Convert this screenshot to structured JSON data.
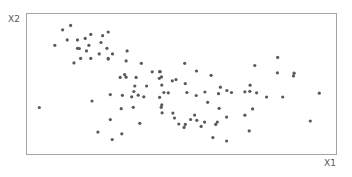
{
  "chart_data": {
    "type": "scatter",
    "title": "",
    "xlabel": "X1",
    "ylabel": "X2",
    "grid": false,
    "legend": null,
    "axis_ticks": false,
    "marker_color": "#595959",
    "frame_color": "#a6a6a6",
    "xlim": [
      0,
      100
    ],
    "ylim": [
      0,
      100
    ],
    "points": [
      [
        14.4,
        91.2
      ],
      [
        11.8,
        88.1
      ],
      [
        13.3,
        80.9
      ],
      [
        16.6,
        80.9
      ],
      [
        9.3,
        77.1
      ],
      [
        16.6,
        75.0
      ],
      [
        17.6,
        67.8
      ],
      [
        20.3,
        77.1
      ],
      [
        26.5,
        86.5
      ],
      [
        20.9,
        84.8
      ],
      [
        24.7,
        83.9
      ],
      [
        19.1,
        82.0
      ],
      [
        24.2,
        79.1
      ],
      [
        17.2,
        74.8
      ],
      [
        26.1,
        75.0
      ],
      [
        19.5,
        73.1
      ],
      [
        23.6,
        71.0
      ],
      [
        27.9,
        71.0
      ],
      [
        15.5,
        64.6
      ],
      [
        20.9,
        67.8
      ],
      [
        26.5,
        67.3
      ],
      [
        32.6,
        73.1
      ],
      [
        37.2,
        64.3
      ],
      [
        32.3,
        66.0
      ],
      [
        35.5,
        54.3
      ],
      [
        31.8,
        56.3
      ],
      [
        32.3,
        54.5
      ],
      [
        30.4,
        54.3
      ],
      [
        38.9,
        48.2
      ],
      [
        43.7,
        54.7
      ],
      [
        40.7,
        58.3
      ],
      [
        43.1,
        58.4
      ],
      [
        43.3,
        58.4
      ],
      [
        35.1,
        48.2
      ],
      [
        36.2,
        41.7
      ],
      [
        38.0,
        40.6
      ],
      [
        34.1,
        40.6
      ],
      [
        31.1,
        41.6
      ],
      [
        34.8,
        44.3
      ],
      [
        43.1,
        40.2
      ],
      [
        51.4,
        49.9
      ],
      [
        47.2,
        51.9
      ],
      [
        43.0,
        53.7
      ],
      [
        44.5,
        43.6
      ],
      [
        51.9,
        43.6
      ],
      [
        43.8,
        48.9
      ],
      [
        43.6,
        33.1
      ],
      [
        34.6,
        33.1
      ],
      [
        27.2,
        42.1
      ],
      [
        21.3,
        37.6
      ],
      [
        30.7,
        32.1
      ],
      [
        30.9,
        14.3
      ],
      [
        27.2,
        24.4
      ],
      [
        43.8,
        34.8
      ],
      [
        27.8,
        10.3
      ],
      [
        36.7,
        21.8
      ],
      [
        23.2,
        15.5
      ],
      [
        4.3,
        33.0
      ],
      [
        26.5,
        67.8
      ],
      [
        51.2,
        64.3
      ],
      [
        55.0,
        58.9
      ],
      [
        45.9,
        43.4
      ],
      [
        48.4,
        52.8
      ],
      [
        54.9,
        41.5
      ],
      [
        47.9,
        25.5
      ],
      [
        53.1,
        24.5
      ],
      [
        49.3,
        21.3
      ],
      [
        54.4,
        27.6
      ],
      [
        51.4,
        21.0
      ],
      [
        55.1,
        23.9
      ],
      [
        43.9,
        29.2
      ],
      [
        47.4,
        29.0
      ],
      [
        51.0,
        18.9
      ],
      [
        59.7,
        55.8
      ],
      [
        62.7,
        47.4
      ],
      [
        64.8,
        45.0
      ],
      [
        70.6,
        44.1
      ],
      [
        66.3,
        43.6
      ],
      [
        62.1,
        42.8
      ],
      [
        57.7,
        44.0
      ],
      [
        58.6,
        36.7
      ],
      [
        64.7,
        26.2
      ],
      [
        62.3,
        32.4
      ],
      [
        57.6,
        22.6
      ],
      [
        61.7,
        22.6
      ],
      [
        61.2,
        21.0
      ],
      [
        56.5,
        19.6
      ],
      [
        73.1,
        32.0
      ],
      [
        70.6,
        27.5
      ],
      [
        74.4,
        43.4
      ],
      [
        60.3,
        11.6
      ],
      [
        64.7,
        9.2
      ],
      [
        77.6,
        40.4
      ],
      [
        81.2,
        68.5
      ],
      [
        73.8,
        62.8
      ],
      [
        86.3,
        55.4
      ],
      [
        81.1,
        57.6
      ],
      [
        86.5,
        57.3
      ],
      [
        82.8,
        40.4
      ],
      [
        94.6,
        43.1
      ],
      [
        91.7,
        23.4
      ],
      [
        72.3,
        48.8
      ],
      [
        72.2,
        44.5
      ],
      [
        72.0,
        16.4
      ]
    ]
  },
  "labels": {
    "x_axis": "X1",
    "y_axis": "X2"
  }
}
